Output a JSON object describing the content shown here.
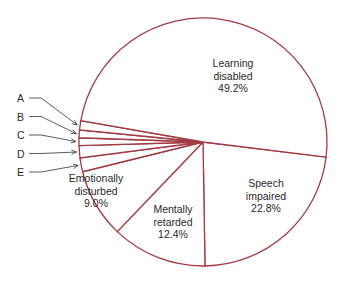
{
  "chart_data": {
    "type": "pie",
    "title": "",
    "start_angle_deg": 97,
    "direction": "clockwise",
    "slices": [
      {
        "label": "Speech impaired",
        "lines": [
          "Speech",
          "impaired",
          "22.8%"
        ],
        "value": 22.8
      },
      {
        "label": "Mentally retarded",
        "lines": [
          "Mentally",
          "retarded",
          "12.4%"
        ],
        "value": 12.4
      },
      {
        "label": "Emotionally disturbed",
        "lines": [
          "Emotionally",
          "disturbed",
          "9.0%"
        ],
        "value": 9.0
      },
      {
        "label": "E",
        "lines": [],
        "value": 1.8
      },
      {
        "label": "D",
        "lines": [],
        "value": 1.6
      },
      {
        "label": "C",
        "lines": [],
        "value": 1.0
      },
      {
        "label": "B",
        "lines": [],
        "value": 1.0
      },
      {
        "label": "A",
        "lines": [],
        "value": 1.2
      },
      {
        "label": "Learning disabled",
        "lines": [
          "Learning",
          "disabled",
          "49.2%"
        ],
        "value": 49.2
      }
    ],
    "side_labels": [
      "A",
      "B",
      "C",
      "D",
      "E"
    ],
    "colors": {
      "stroke": "#a23b44",
      "fill": "#ffffff",
      "text": "#2a2a2a",
      "leader": "#333333"
    },
    "legend": "none"
  }
}
